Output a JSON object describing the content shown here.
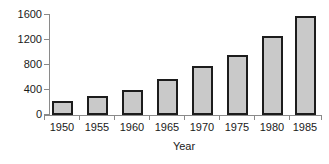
{
  "chart_data": {
    "type": "bar",
    "title": "",
    "xlabel": "Year",
    "ylabel": "",
    "categories": [
      "1950",
      "1955",
      "1960",
      "1965",
      "1970",
      "1975",
      "1980",
      "1985"
    ],
    "values": [
      230,
      300,
      400,
      580,
      790,
      965,
      1265,
      1580
    ],
    "series": [
      {
        "name": "",
        "values": [
          230,
          300,
          400,
          580,
          790,
          965,
          1265,
          1580
        ]
      }
    ],
    "ylim": [
      0,
      1600
    ],
    "yticks": [
      0,
      400,
      800,
      1200,
      1600
    ],
    "ytick_labels": [
      "0",
      "400",
      "800",
      "1200",
      "1600"
    ],
    "xtick_labels": [
      "1950",
      "1955",
      "1960",
      "1965",
      "1970",
      "1975",
      "1980",
      "1985"
    ],
    "grid": false,
    "legend": false,
    "legend_position": "none",
    "bar_fill_color": "#c9c9c9",
    "bar_edge_color": "#1c1c1c",
    "axis_color": "#8a8a8a",
    "text_color": "#1a1a1a",
    "background_color": "#ffffff"
  }
}
